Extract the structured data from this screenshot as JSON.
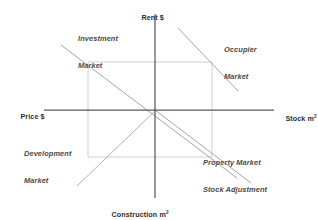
{
  "diagram": {
    "type": "four-quadrant-diagram",
    "background_color": "#ffffff",
    "axis_color": "#5a5a5a",
    "curve_color": "#8d8d8d",
    "guide_color": "#c2c2c2",
    "text_color": "#3a3a3a",
    "origin": {
      "x": 155,
      "y": 110
    }
  },
  "axes": {
    "up": {
      "name": "rent-axis",
      "label": "Rent $",
      "unit": "",
      "direction": "up",
      "end": {
        "x": 155,
        "y": 14
      }
    },
    "right": {
      "name": "stock-axis",
      "label": "Stock m",
      "unit": "2",
      "direction": "right",
      "end": {
        "x": 274,
        "y": 110
      }
    },
    "down": {
      "name": "construction-axis",
      "label": "Construction m",
      "unit": "2",
      "direction": "down",
      "end": {
        "x": 155,
        "y": 198
      }
    },
    "left": {
      "name": "price-axis",
      "label": "Price $",
      "unit": "",
      "direction": "left",
      "end": {
        "x": 44,
        "y": 110
      }
    }
  },
  "quadrants": [
    {
      "id": "investment-market",
      "label_line1": "Investment",
      "label_line2": "Market",
      "position": "top-left",
      "function_line": {
        "x1": 61,
        "y1": 45,
        "x2": 237,
        "y2": 178
      },
      "description": "Rent to Price valuation relation"
    },
    {
      "id": "occupier-market",
      "label_line1": "Occupier",
      "label_line2": "Market",
      "position": "top-right",
      "function_line": {
        "x1": 178,
        "y1": 28,
        "x2": 237,
        "y2": 90
      },
      "description": "Rent determined by demand for space"
    },
    {
      "id": "development-market",
      "label_line1": "Development",
      "label_line2": "Market",
      "position": "bottom-left",
      "function_line": {
        "x1": 77,
        "y1": 185,
        "x2": 155,
        "y2": 110
      },
      "description": "Price to new construction relation"
    },
    {
      "id": "property-market-stock-adjustment",
      "label_line1": "Property Market",
      "label_line2": "Stock Adjustment",
      "position": "bottom-right",
      "function_line": {
        "x1": 155,
        "y1": 110,
        "x2": 250,
        "y2": 182
      },
      "description": "Construction to stock adjustment"
    }
  ],
  "equilibrium_box": {
    "name": "equilibrium-rectangle",
    "left": 88,
    "top": 62,
    "right": 212,
    "bottom": 157,
    "style": "thin-light-guide-lines"
  }
}
